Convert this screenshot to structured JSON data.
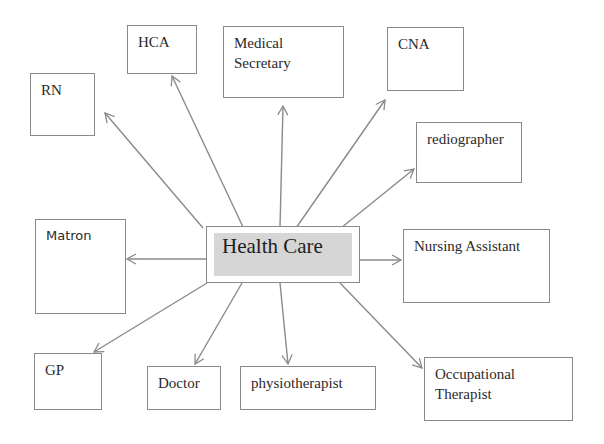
{
  "diagram": {
    "center": {
      "label": "Health Care",
      "fill_color": "#d6d6d6"
    },
    "line_color": "#8a8a8a",
    "nodes": [
      {
        "id": "rn",
        "label": "RN"
      },
      {
        "id": "hca",
        "label": "HCA"
      },
      {
        "id": "medical-secretary",
        "label": "Medical\nSecretary"
      },
      {
        "id": "cna",
        "label": "CNA"
      },
      {
        "id": "rediographer",
        "label": "rediographer"
      },
      {
        "id": "matron",
        "label": "Matron"
      },
      {
        "id": "nursing-assistant",
        "label": "Nursing Assistant"
      },
      {
        "id": "gp",
        "label": "GP"
      },
      {
        "id": "doctor",
        "label": "Doctor"
      },
      {
        "id": "physiotherapist",
        "label": "physiotherapist"
      },
      {
        "id": "occupational-therapist",
        "label": "Occupational\nTherapist"
      }
    ]
  }
}
